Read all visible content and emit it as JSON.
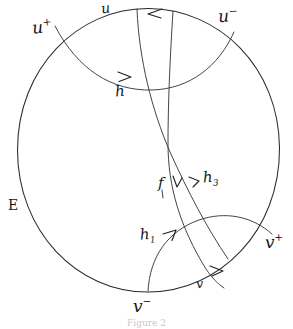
{
  "figure": {
    "domain_type": "hand-drawn-mathematical-diagram",
    "caption": "Figure 2",
    "boundary": {
      "name": "E",
      "label": "E",
      "description": "boundary-circle"
    },
    "ideal_points": [
      {
        "id": "u-plus",
        "base": "u",
        "sign": "+",
        "label": "u",
        "superscript": "+"
      },
      {
        "id": "u-minus",
        "base": "u",
        "sign": "-",
        "label": "u",
        "superscript": "−"
      },
      {
        "id": "v-plus",
        "base": "v",
        "sign": "+",
        "label": "v",
        "superscript": "+"
      },
      {
        "id": "v-minus",
        "base": "v",
        "sign": "-",
        "label": "v",
        "superscript": "−"
      }
    ],
    "curve_labels": [
      {
        "id": "u",
        "label": "u",
        "subscript": ""
      },
      {
        "id": "v",
        "label": "v",
        "subscript": ""
      },
      {
        "id": "h",
        "label": "h",
        "subscript": ""
      },
      {
        "id": "h1",
        "label": "h",
        "subscript": "1"
      },
      {
        "id": "h3",
        "label": "h",
        "subscript": "3"
      },
      {
        "id": "f",
        "label": "f",
        "subscript": ""
      }
    ],
    "colors": {
      "ink": "#2b2b2b",
      "paper": "#ffffff",
      "caption": "#c9c9c9"
    }
  }
}
